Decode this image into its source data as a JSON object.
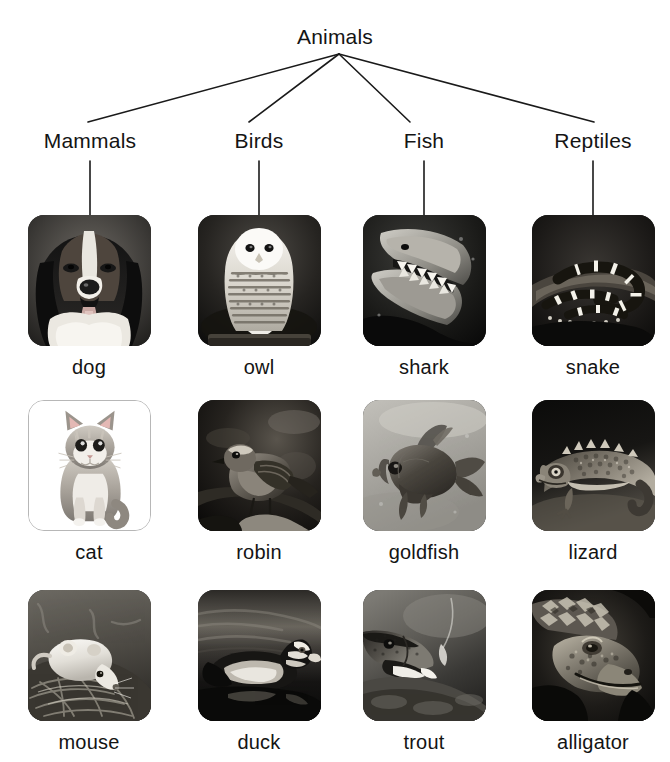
{
  "diagram": {
    "title": "Animals",
    "type": "tree-hierarchy",
    "root": {
      "label": "Animals",
      "x": 339,
      "y": 40
    },
    "apex": {
      "x": 339,
      "y": 54
    },
    "categories": [
      {
        "label": "Mammals",
        "x": 90,
        "stem_top": 160,
        "stem_bottom": 215
      },
      {
        "label": "Birds",
        "x": 259,
        "stem_top": 160,
        "stem_bottom": 215
      },
      {
        "label": "Fish",
        "x": 424,
        "stem_top": 160,
        "stem_bottom": 215
      },
      {
        "label": "Reptiles",
        "x": 593,
        "stem_top": 160,
        "stem_bottom": 215
      }
    ],
    "rows": [
      {
        "image_top": 215,
        "caption_top": 350
      },
      {
        "image_top": 400,
        "caption_top": 535
      },
      {
        "image_top": 590,
        "caption_top": 725
      }
    ],
    "items": [
      {
        "caption": "dog",
        "category": "Mammals",
        "col": 0,
        "row": 0,
        "cx": 89,
        "picture": "dog-photo",
        "framed": false,
        "bg": "#3a3a3a"
      },
      {
        "caption": "owl",
        "category": "Birds",
        "col": 1,
        "row": 0,
        "cx": 259,
        "picture": "owl-photo",
        "framed": false,
        "bg": "#232323"
      },
      {
        "caption": "shark",
        "category": "Fish",
        "col": 2,
        "row": 0,
        "cx": 424,
        "picture": "shark-photo",
        "framed": false,
        "bg": "#1c1c1c"
      },
      {
        "caption": "snake",
        "category": "Reptiles",
        "col": 3,
        "row": 0,
        "cx": 593,
        "picture": "snake-photo",
        "framed": false,
        "bg": "#1a1a1a"
      },
      {
        "caption": "cat",
        "category": "Mammals",
        "col": 0,
        "row": 1,
        "cx": 89,
        "picture": "cat-photo",
        "framed": true,
        "bg": "#ffffff"
      },
      {
        "caption": "robin",
        "category": "Birds",
        "col": 1,
        "row": 1,
        "cx": 259,
        "picture": "robin-photo",
        "framed": false,
        "bg": "#1f1f1f"
      },
      {
        "caption": "goldfish",
        "category": "Fish",
        "col": 2,
        "row": 1,
        "cx": 424,
        "picture": "goldfish-photo",
        "framed": false,
        "bg": "#a9a9a9"
      },
      {
        "caption": "lizard",
        "category": "Reptiles",
        "col": 3,
        "row": 1,
        "cx": 593,
        "picture": "lizard-photo",
        "framed": false,
        "bg": "#151515"
      },
      {
        "caption": "mouse",
        "category": "Mammals",
        "col": 0,
        "row": 2,
        "cx": 89,
        "picture": "mouse-photo",
        "framed": false,
        "bg": "#4a4a4a"
      },
      {
        "caption": "duck",
        "category": "Birds",
        "col": 1,
        "row": 2,
        "cx": 259,
        "picture": "duck-photo",
        "framed": false,
        "bg": "#2b2b2b"
      },
      {
        "caption": "trout",
        "category": "Fish",
        "col": 2,
        "row": 2,
        "cx": 424,
        "picture": "trout-photo",
        "framed": false,
        "bg": "#3d3d3d"
      },
      {
        "caption": "alligator",
        "category": "Reptiles",
        "col": 3,
        "row": 2,
        "cx": 593,
        "picture": "alligator-photo",
        "framed": false,
        "bg": "#161616"
      }
    ],
    "style": {
      "background": "#ffffff",
      "text_color": "#141414",
      "line_color": "#1a1a1a",
      "line_width": 1.6,
      "thumb_radius": 16,
      "thumb_width": 123,
      "thumb_height": 131,
      "frame_border": "#b7b7b7"
    }
  }
}
